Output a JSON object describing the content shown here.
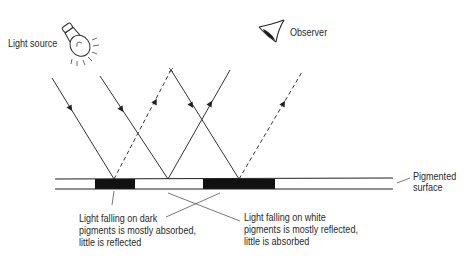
{
  "labels": {
    "light_source": "Light source",
    "observer": "Observer",
    "pigmented_surface_line1": "Pigmented",
    "pigmented_surface_line2": "surface",
    "dark_caption": [
      "Light falling on dark",
      "pigments is mostly absorbed,",
      "little is reflected"
    ],
    "white_caption": [
      "Light falling on white",
      "pigments is mostly reflected,",
      "little is absorbed"
    ]
  },
  "icons": {
    "light_source": "light-bulb-icon",
    "observer": "eye-icon"
  },
  "colors": {
    "line": "#333333",
    "pigment_dark": "#111111",
    "background": "#ffffff"
  },
  "rays": [
    {
      "type": "incident",
      "style": "solid",
      "from": [
        52,
        78
      ],
      "to": [
        114,
        179
      ]
    },
    {
      "type": "reflected-weak",
      "style": "dashed",
      "from": [
        114,
        179
      ],
      "to": [
        171,
        70
      ]
    },
    {
      "type": "incident",
      "style": "solid",
      "from": [
        100,
        76
      ],
      "to": [
        168,
        179
      ]
    },
    {
      "type": "reflected-strong",
      "style": "solid",
      "from": [
        168,
        179
      ],
      "to": [
        230,
        70
      ]
    },
    {
      "type": "incident",
      "style": "solid",
      "from": [
        171,
        70
      ],
      "to": [
        239,
        179
      ]
    },
    {
      "type": "reflected-weak",
      "style": "dashed",
      "from": [
        239,
        179
      ],
      "to": [
        302,
        72
      ]
    }
  ],
  "surface": {
    "x_start": 55,
    "x_end": 393,
    "dark_segments": [
      [
        95,
        135
      ],
      [
        203,
        275
      ]
    ]
  }
}
